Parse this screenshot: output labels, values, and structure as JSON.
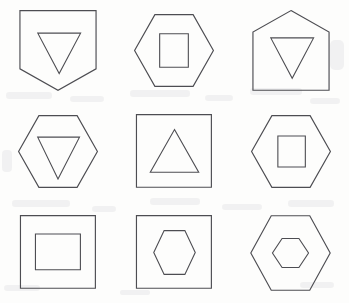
{
  "figure": {
    "rows": 3,
    "columns": 3,
    "width": 349,
    "height": 303
  },
  "style": {
    "background_color": "#fdfdfc",
    "stroke_color": "#4d4d52",
    "fill": "none",
    "stroke_width": 1.15
  },
  "cells": [
    {
      "index": 1,
      "row": 1,
      "column": 1,
      "label": "pentagon-down with triangle-down",
      "outer_shape": "pentagon-down",
      "outer_points": "4,3 68,3 68,52 36,70 4,52",
      "inner_shape": "triangle-down",
      "inner_points": "19,22 55,22 37,56",
      "viewbox": "0 0 72 74"
    },
    {
      "index": 2,
      "row": 1,
      "column": 2,
      "label": "hexagon with square",
      "outer_shape": "hexagon",
      "outer_points": "20,3 52,3 69,33 52,63 20,63 3,33",
      "inner_shape": "square",
      "inner_points": "24,19 48,19 48,47 24,47",
      "viewbox": "0 0 72 66"
    },
    {
      "index": 3,
      "row": 1,
      "column": 3,
      "label": "pentagon-up with triangle-down",
      "outer_shape": "pentagon-up",
      "outer_points": "36,3 68,21 68,70 4,70 4,21",
      "inner_shape": "triangle-down",
      "inner_points": "19,26 55,26 37,60",
      "viewbox": "0 0 72 74"
    },
    {
      "index": 4,
      "row": 2,
      "column": 1,
      "label": "hexagon with triangle-down",
      "outer_shape": "hexagon",
      "outer_points": "20,3 52,3 69,33 52,63 20,63 3,33",
      "inner_shape": "triangle-down",
      "inner_points": "19,21 54,21 36,56",
      "viewbox": "0 0 72 66"
    },
    {
      "index": 5,
      "row": 2,
      "column": 2,
      "label": "square with triangle-up",
      "outer_shape": "square",
      "outer_points": "3,3 68,3 68,66 3,66",
      "inner_shape": "triangle-up",
      "inner_points": "36,16 57,53 15,53",
      "viewbox": "0 0 72 70"
    },
    {
      "index": 6,
      "row": 2,
      "column": 3,
      "label": "hexagon with square",
      "outer_shape": "hexagon",
      "outer_points": "20,3 52,3 69,33 52,63 20,63 3,33",
      "inner_shape": "square",
      "inner_points": "25,20 48,20 48,46 25,46",
      "viewbox": "0 0 72 66"
    },
    {
      "index": 7,
      "row": 3,
      "column": 1,
      "label": "square with rectangle",
      "outer_shape": "square",
      "outer_points": "3,3 68,3 68,66 3,66",
      "inner_shape": "rectangle",
      "inner_points": "16,19 55,19 55,50 16,50",
      "viewbox": "0 0 72 70"
    },
    {
      "index": 8,
      "row": 3,
      "column": 2,
      "label": "square with hexagon",
      "outer_shape": "square",
      "outer_points": "3,3 68,3 68,66 3,66",
      "inner_shape": "hexagon",
      "inner_points": "27,16 45,16 54,35 45,54 27,54 18,35",
      "viewbox": "0 0 72 70"
    },
    {
      "index": 9,
      "row": 3,
      "column": 3,
      "label": "hexagon with hexagon",
      "outer_shape": "hexagon",
      "outer_points": "21,3 53,3 70,34 53,65 21,65 4,34",
      "inner_shape": "hexagon",
      "inner_points": "30,22 44,22 52,34 44,46 30,46 22,34",
      "viewbox": "0 0 74 68"
    }
  ]
}
